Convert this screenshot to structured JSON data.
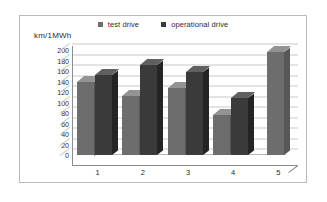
{
  "chart_data": {
    "type": "bar",
    "title": "",
    "subtitle": "",
    "xlabel": "",
    "ylabel": "km/1MWh",
    "categories": [
      "1",
      "2",
      "3",
      "4",
      "5"
    ],
    "series": [
      {
        "name": "test drive",
        "color": "#6d6d6d",
        "values": [
          140,
          112,
          128,
          76,
          196
        ]
      },
      {
        "name": "operational drive",
        "color": "#3a3a3a",
        "values": [
          152,
          172,
          158,
          108,
          null
        ]
      }
    ],
    "ylim": [
      0,
      200
    ],
    "ytick_step": 20,
    "yticks": [
      200,
      180,
      160,
      140,
      120,
      100,
      80,
      60,
      40,
      20,
      0
    ],
    "grid": true,
    "legend_position": "top",
    "style": "3d-column",
    "background_color": "#ffffff",
    "border_color": "#b9b9b9",
    "gridline_color": "#c9c9c9",
    "axis_color": "#8d8d8d"
  }
}
